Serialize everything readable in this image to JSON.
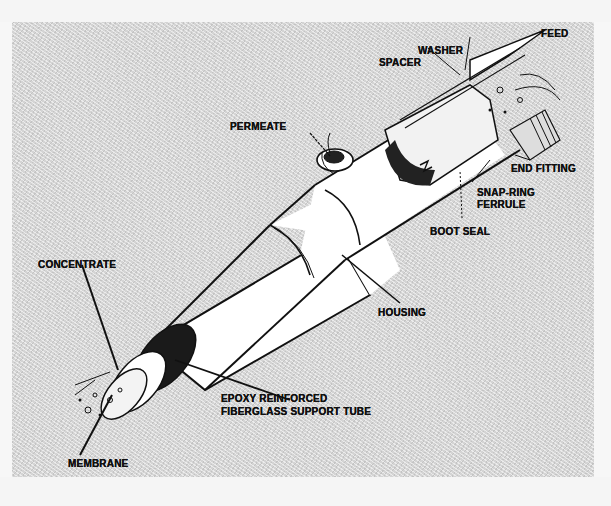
{
  "figure": {
    "colors": {
      "background_panel": "#d4d4d4",
      "page": "#f7f7f7",
      "ink": "#111111",
      "housing_fill": "#ffffff"
    },
    "labels": {
      "feed": "FEED",
      "washer": "WASHER",
      "spacer": "SPACER",
      "permeate": "PERMEATE",
      "end_fitting": "END FITTING",
      "snap_ring_line1": "SNAP-RING",
      "snap_ring_line2": "FERRULE",
      "boot_seal": "BOOT SEAL",
      "concentrate": "CONCENTRATE",
      "housing": "HOUSING",
      "support_tube_line1": "EPOXY REINFORCED",
      "support_tube_line2": "FIBERGLASS SUPPORT TUBE",
      "membrane": "MEMBRANE"
    }
  }
}
